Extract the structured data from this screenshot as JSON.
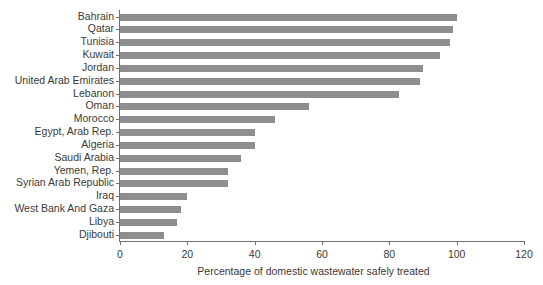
{
  "chart_data": {
    "type": "bar",
    "orientation": "horizontal",
    "title": "",
    "xlabel": "Percentage of domestic wastewater safely treated",
    "ylabel": "",
    "xlim": [
      0,
      120
    ],
    "xticks": [
      0,
      20,
      40,
      60,
      80,
      100,
      120
    ],
    "grid": false,
    "legend": null,
    "bar_color": "#8e8e8e",
    "axis_color": "#6f6f6f",
    "text_color": "#3a3a3a",
    "categories": [
      "Bahrain",
      "Qatar",
      "Tunisia",
      "Kuwait",
      "Jordan",
      "United Arab Emirates",
      "Lebanon",
      "Oman",
      "Morocco",
      "Egypt, Arab Rep.",
      "Algeria",
      "Saudi Arabia",
      "Yemen, Rep.",
      "Syrian Arab Republic",
      "Iraq",
      "West Bank And Gaza",
      "Libya",
      "Djibouti"
    ],
    "values": [
      100,
      99,
      98,
      95,
      90,
      89,
      83,
      56,
      46,
      40,
      40,
      36,
      32,
      32,
      20,
      18,
      17,
      13
    ]
  }
}
